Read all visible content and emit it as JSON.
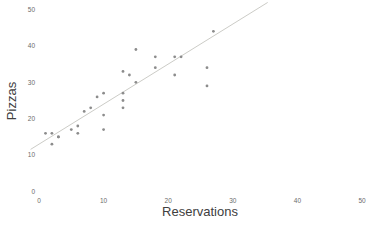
{
  "figure": {
    "background": "#ffffff"
  },
  "chart_data": {
    "type": "scatter",
    "title": "",
    "xlabel": "Reservations",
    "ylabel": "Pizzas",
    "x": [
      13,
      2,
      14,
      13,
      1,
      18,
      10,
      26,
      3,
      3,
      21,
      7,
      22,
      2,
      27,
      6,
      10,
      18,
      15,
      9,
      26,
      8,
      15,
      10,
      21,
      5,
      6,
      13,
      13
    ],
    "y": [
      33,
      16,
      32,
      27,
      16,
      34,
      17,
      29,
      15,
      15,
      32,
      22,
      37,
      13,
      44,
      16,
      21,
      37,
      30,
      26,
      34,
      23,
      39,
      27,
      37,
      17,
      18,
      25,
      23
    ],
    "xlim": [
      0,
      50
    ],
    "ylim": [
      0,
      50
    ],
    "x_ticks": [
      0,
      10,
      20,
      30,
      40,
      50
    ],
    "y_ticks": [
      0,
      10,
      20,
      30,
      40,
      50
    ],
    "grid": false,
    "legend": null,
    "trend_line": {
      "slope": 1.1,
      "intercept": 13,
      "x_start": -1.3,
      "x_end": 35.4,
      "color": "#ccccc7"
    },
    "colors": {
      "marker": "#8c8c8c",
      "tick_label": "#6b6b6b",
      "axis_label": "#404040"
    }
  }
}
